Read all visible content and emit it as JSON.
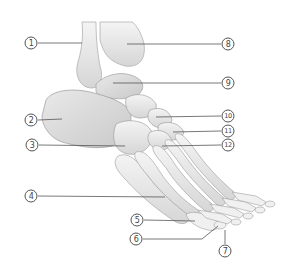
{
  "diagram": {
    "line_color": "#555555",
    "bone_shade": "#d9d9d9",
    "labels": [
      {
        "id": "1",
        "text": "1",
        "cx": 31,
        "cy": 43,
        "x1": 38,
        "y1": 43,
        "x2": 82,
        "y2": 43
      },
      {
        "id": "2",
        "text": "2",
        "cx": 31,
        "cy": 120,
        "x1": 38,
        "y1": 120,
        "x2": 62,
        "y2": 119
      },
      {
        "id": "3",
        "text": "3",
        "cx": 32,
        "cy": 145,
        "x1": 39,
        "y1": 145,
        "x2": 125,
        "y2": 146
      },
      {
        "id": "4",
        "text": "4",
        "cx": 31,
        "cy": 196,
        "x1": 38,
        "y1": 196,
        "x2": 165,
        "y2": 197
      },
      {
        "id": "5",
        "text": "5",
        "cx": 137,
        "cy": 220,
        "x1": 144,
        "y1": 220,
        "x2": 195,
        "y2": 221
      },
      {
        "id": "6",
        "text": "6",
        "cx": 136,
        "cy": 239,
        "x1": 143,
        "y1": 239,
        "x2": 202,
        "y2": 239
      },
      {
        "id": "7",
        "text": "7",
        "cx": 225,
        "cy": 251,
        "x1": 225,
        "y1": 244,
        "x2": 225,
        "y2": 230
      },
      {
        "id": "8",
        "text": "8",
        "cx": 228,
        "cy": 44,
        "x1": 127,
        "y1": 44,
        "x2": 221,
        "y2": 44
      },
      {
        "id": "9",
        "text": "9",
        "cx": 228,
        "cy": 83,
        "x1": 113,
        "y1": 83,
        "x2": 221,
        "y2": 83
      },
      {
        "id": "10",
        "text": "10",
        "cx": 228,
        "cy": 116,
        "x1": 156,
        "y1": 117,
        "x2": 221,
        "y2": 116
      },
      {
        "id": "11",
        "text": "11",
        "cx": 228,
        "cy": 131,
        "x1": 173,
        "y1": 132,
        "x2": 221,
        "y2": 131
      },
      {
        "id": "12",
        "text": "12",
        "cx": 228,
        "cy": 145,
        "x1": 162,
        "y1": 146,
        "x2": 221,
        "y2": 145
      }
    ],
    "extra_segments": [
      {
        "for": "6",
        "x1": 202,
        "y1": 239,
        "x2": 218,
        "y2": 226
      }
    ]
  }
}
